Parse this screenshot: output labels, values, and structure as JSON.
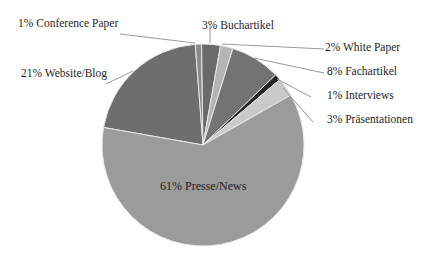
{
  "chart_data": {
    "type": "pie",
    "title": "",
    "start_angle_deg": 280,
    "direction": "clockwise",
    "slices": [
      {
        "label": "Website/Blog",
        "value": 21,
        "color": "#6e6e6e",
        "label_text": "21% Website/Blog"
      },
      {
        "label": "Conference Paper",
        "value": 1,
        "color": "#8a8a8a",
        "label_text": "1% Conference  Paper"
      },
      {
        "label": "Buchartikel",
        "value": 3,
        "color": "#6a6a6a",
        "label_text": "3% Buchartikel"
      },
      {
        "label": "White Paper",
        "value": 2,
        "color": "#b4b4b4",
        "label_text": "2% White  Paper"
      },
      {
        "label": "Fachartikel",
        "value": 8,
        "color": "#737373",
        "label_text": "8% Fachartikel"
      },
      {
        "label": "Interviews",
        "value": 1,
        "color": "#262626",
        "label_text": "1% Interviews"
      },
      {
        "label": "Präsentationen",
        "value": 3,
        "color": "#c9c9c9",
        "label_text": "3% Präsentationen"
      },
      {
        "label": "Presse/News",
        "value": 61,
        "color": "#9b9b9b",
        "label_text": "61% Presse/News"
      }
    ],
    "legend": "none",
    "data_labels": "outside with leader lines (except Presse/News inside)"
  },
  "labels": {
    "website_blog": "21% Website/Blog",
    "conference_paper": "1% Conference  Paper",
    "buchartikel": "3% Buchartikel",
    "white_paper": "2% White  Paper",
    "fachartikel": "8% Fachartikel",
    "interviews": "1% Interviews",
    "praesentationen": "3% Präsentationen",
    "presse_news": "61% Presse/News"
  }
}
